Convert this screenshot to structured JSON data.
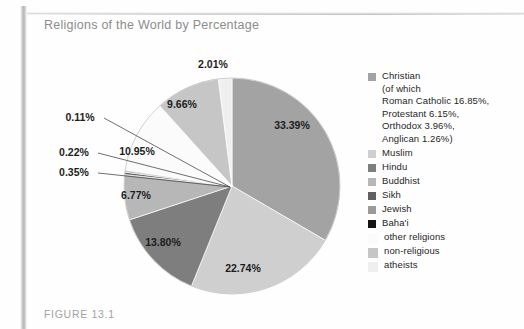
{
  "figure": {
    "title": "Religions of the World by Percentage",
    "caption": "FIGURE 13.1"
  },
  "chart_data": {
    "type": "pie",
    "title": "Religions of the World by Percentage",
    "xlabel": "",
    "ylabel": "",
    "units": "percent",
    "legend_position": "right",
    "grid": false,
    "categories": [
      "Christian",
      "Muslim",
      "Hindu",
      "Buddhist",
      "Sikh",
      "Jewish",
      "Baha'i",
      "other religions",
      "non-religious",
      "atheists"
    ],
    "values": [
      33.39,
      22.74,
      13.8,
      6.77,
      0.35,
      0.22,
      0.11,
      10.95,
      9.66,
      2.01
    ],
    "slice_labels": [
      "33.39%",
      "22.74%",
      "13.80%",
      "6.77%",
      "0.35%",
      "0.22%",
      "0.11%",
      "10.95%",
      "9.66%",
      "2.01%"
    ],
    "colors": [
      "#a3a3a3",
      "#cfcfcf",
      "#7e7e7e",
      "#b7b7b7",
      "#606060",
      "#9a9a9a",
      "#141414",
      "#fbfbfb",
      "#c6c6c6",
      "#efefef"
    ],
    "subdivisions": [
      {
        "parent": "Christian",
        "name": "Roman Catholic",
        "value": 16.85
      },
      {
        "parent": "Christian",
        "name": "Protestant",
        "value": 6.15
      },
      {
        "parent": "Christian",
        "name": "Orthodox",
        "value": 3.96
      },
      {
        "parent": "Christian",
        "name": "Anglican",
        "value": 1.26
      }
    ]
  },
  "legend": {
    "items": [
      {
        "label": "Christian\n(of which\nRoman Catholic 16.85%,\nProtestant 6.15%,\nOrthodox 3.96%,\nAnglican 1.26%)",
        "color": "#a3a3a3"
      },
      {
        "label": "Muslim",
        "color": "#cfcfcf"
      },
      {
        "label": "Hindu",
        "color": "#7e7e7e"
      },
      {
        "label": "Buddhist",
        "color": "#b7b7b7"
      },
      {
        "label": "Sikh",
        "color": "#606060"
      },
      {
        "label": "Jewish",
        "color": "#9a9a9a"
      },
      {
        "label": "Baha'i",
        "color": "#141414"
      },
      {
        "label": "other religions",
        "color": "#fbfbfb"
      },
      {
        "label": "non-religious",
        "color": "#c6c6c6"
      },
      {
        "label": "atheists",
        "color": "#efefef"
      }
    ]
  },
  "pie_geometry": {
    "center_x": 232,
    "center_y": 186,
    "radius": 108,
    "start_angle_deg": -90
  },
  "slice_label_positions": [
    {
      "text": "33.39%",
      "x": 292,
      "y": 129,
      "anchor": "middle",
      "leader": false
    },
    {
      "text": "22.74%",
      "x": 243,
      "y": 272,
      "anchor": "middle",
      "leader": false
    },
    {
      "text": "13.80%",
      "x": 163,
      "y": 246,
      "anchor": "middle",
      "leader": false
    },
    {
      "text": "6.77%",
      "x": 136,
      "y": 199,
      "anchor": "middle",
      "leader": false
    },
    {
      "text": "0.35%",
      "x": 74,
      "y": 176,
      "anchor": "middle",
      "leader": true
    },
    {
      "text": "0.22%",
      "x": 74,
      "y": 156,
      "anchor": "middle",
      "leader": true
    },
    {
      "text": "0.11%",
      "x": 80,
      "y": 121,
      "anchor": "middle",
      "leader": true
    },
    {
      "text": "10.95%",
      "x": 137,
      "y": 155,
      "anchor": "middle",
      "leader": false
    },
    {
      "text": "9.66%",
      "x": 182,
      "y": 108,
      "anchor": "middle",
      "leader": false
    },
    {
      "text": "2.01%",
      "x": 213,
      "y": 68,
      "anchor": "middle",
      "leader": false
    }
  ]
}
